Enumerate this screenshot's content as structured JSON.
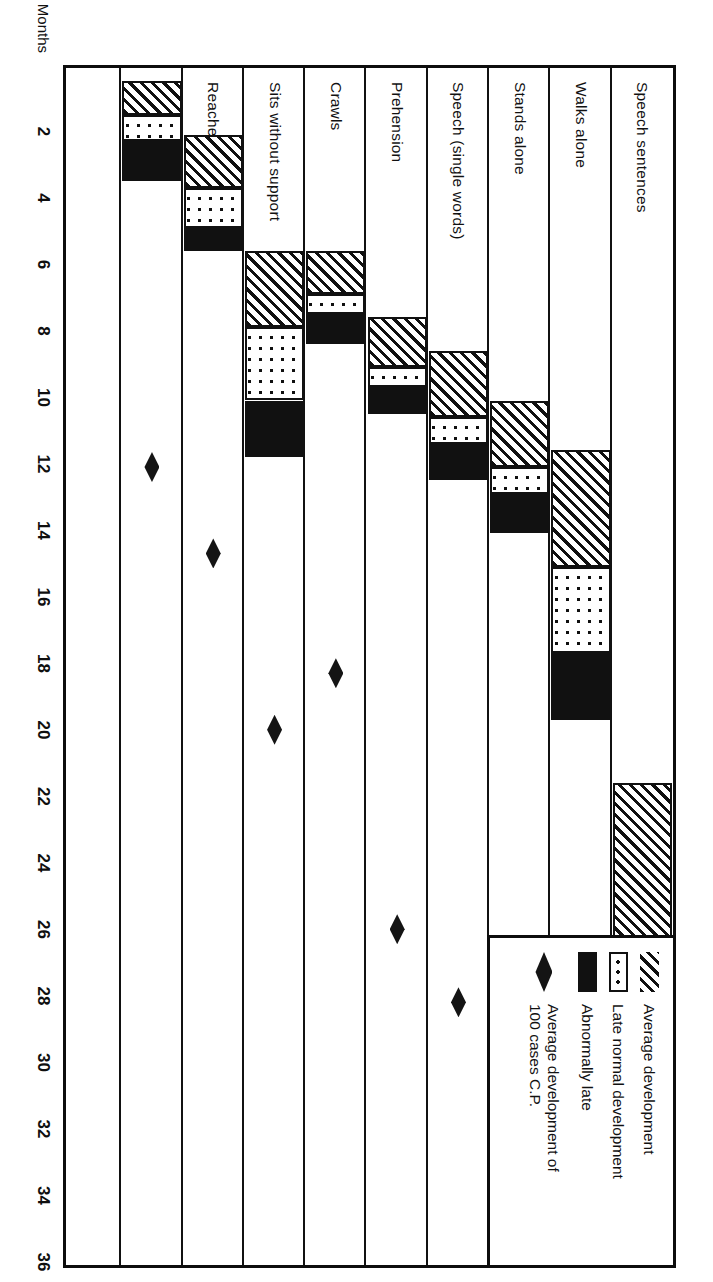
{
  "figure": {
    "axis_title": "Months",
    "axis_ticks": [
      2,
      4,
      6,
      8,
      10,
      12,
      14,
      16,
      18,
      20,
      22,
      24,
      26,
      28,
      30,
      32,
      34,
      36
    ],
    "axis_min": 0,
    "axis_max": 36,
    "ink_color": "#111111",
    "background": "#ffffff"
  },
  "legend": {
    "items": [
      {
        "swatch": "hatch",
        "label": "Average development"
      },
      {
        "swatch": "dots",
        "label": "Late normal development"
      },
      {
        "swatch": "solid",
        "label": "Abnormally late"
      },
      {
        "swatch": "diamond",
        "label": "Average development of\n100 cases  C.P."
      }
    ]
  },
  "chart_data": {
    "type": "bar",
    "title": "",
    "xlabel": "Months",
    "ylabel": "",
    "xlim": [
      0,
      36
    ],
    "grid": false,
    "legend_position": "top-right",
    "categories": [
      "Speech sentences",
      "Walks alone",
      "Stands alone",
      "Speech (single words)",
      "Prehension",
      "Crawls",
      "Sits without support",
      "Reaches for objects",
      "Head control"
    ],
    "series": [
      {
        "name": "Average development",
        "swatch": "hatch",
        "spans": [
          {
            "category": "Speech sentences",
            "start": 21.5,
            "end": 27.0
          },
          {
            "category": "Walks alone",
            "start": 11.5,
            "end": 15.0
          },
          {
            "category": "Stands alone",
            "start": 10.0,
            "end": 12.0
          },
          {
            "category": "Speech (single words)",
            "start": 8.5,
            "end": 10.5
          },
          {
            "category": "Prehension",
            "start": 7.5,
            "end": 9.0
          },
          {
            "category": "Crawls",
            "start": 5.5,
            "end": 6.8
          },
          {
            "category": "Sits without support",
            "start": 5.5,
            "end": 7.8
          },
          {
            "category": "Reaches for objects",
            "start": 2.0,
            "end": 3.6
          },
          {
            "category": "Head control",
            "start": 0.4,
            "end": 1.4
          }
        ]
      },
      {
        "name": "Late normal development",
        "swatch": "dots",
        "spans": [
          {
            "category": "Speech sentences",
            "start": 27.0,
            "end": 32.4
          },
          {
            "category": "Walks alone",
            "start": 15.0,
            "end": 17.6
          },
          {
            "category": "Stands alone",
            "start": 12.0,
            "end": 12.8
          },
          {
            "category": "Speech (single words)",
            "start": 10.5,
            "end": 11.3
          },
          {
            "category": "Prehension",
            "start": 9.0,
            "end": 9.6
          },
          {
            "category": "Crawls",
            "start": 6.8,
            "end": 7.4
          },
          {
            "category": "Sits without support",
            "start": 7.8,
            "end": 10.0
          },
          {
            "category": "Reaches for objects",
            "start": 3.6,
            "end": 4.8
          },
          {
            "category": "Head control",
            "start": 1.4,
            "end": 2.2
          }
        ]
      },
      {
        "name": "Abnormally late",
        "swatch": "solid",
        "spans": [
          {
            "category": "Speech sentences",
            "start": 32.4,
            "end": 36.0
          },
          {
            "category": "Walks alone",
            "start": 17.6,
            "end": 19.6
          },
          {
            "category": "Stands alone",
            "start": 12.8,
            "end": 14.0
          },
          {
            "category": "Speech (single words)",
            "start": 11.3,
            "end": 12.4
          },
          {
            "category": "Prehension",
            "start": 9.6,
            "end": 10.4
          },
          {
            "category": "Crawls",
            "start": 7.4,
            "end": 8.3
          },
          {
            "category": "Sits without support",
            "start": 10.0,
            "end": 11.7
          },
          {
            "category": "Reaches for objects",
            "start": 4.8,
            "end": 5.5
          },
          {
            "category": "Head control",
            "start": 2.2,
            "end": 3.4
          }
        ]
      },
      {
        "name": "Average development of 100 cases C.P.",
        "swatch": "diamond",
        "points": [
          {
            "category": "Walks alone",
            "value": 34.3
          },
          {
            "category": "Stands alone",
            "value": 27.8
          },
          {
            "category": "Speech (single words)",
            "value": 28.1
          },
          {
            "category": "Prehension",
            "value": 25.9
          },
          {
            "category": "Crawls",
            "value": 18.2
          },
          {
            "category": "Sits without support",
            "value": 19.9
          },
          {
            "category": "Reaches for objects",
            "value": 14.6
          },
          {
            "category": "Head control",
            "value": 12.0
          }
        ]
      }
    ]
  }
}
